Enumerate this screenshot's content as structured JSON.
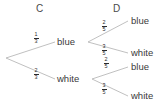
{
  "diagram": {
    "type": "probability-tree",
    "title": "",
    "columns": [
      {
        "label": "C"
      },
      {
        "label": "D"
      }
    ],
    "colors": {
      "edge": "#b9b9b9",
      "text": "#3a3a3a",
      "fraction": "#2b2b2b",
      "background": "#ffffff"
    },
    "stage1": [
      {
        "outcome": "blue",
        "probability": {
          "numerator": "1",
          "denominator": "3"
        }
      },
      {
        "outcome": "white",
        "probability": {
          "numerator": "2",
          "denominator": "3"
        }
      }
    ],
    "stage2": [
      {
        "outcome": "blue",
        "probability": {
          "numerator": "2",
          "denominator": "5"
        }
      },
      {
        "outcome": "white",
        "probability": {
          "numerator": "3",
          "denominator": "5"
        }
      },
      {
        "outcome": "blue",
        "probability": {
          "numerator": "2",
          "denominator": "5"
        }
      },
      {
        "outcome": "white",
        "probability": {
          "numerator": "3",
          "denominator": "5"
        }
      }
    ]
  }
}
